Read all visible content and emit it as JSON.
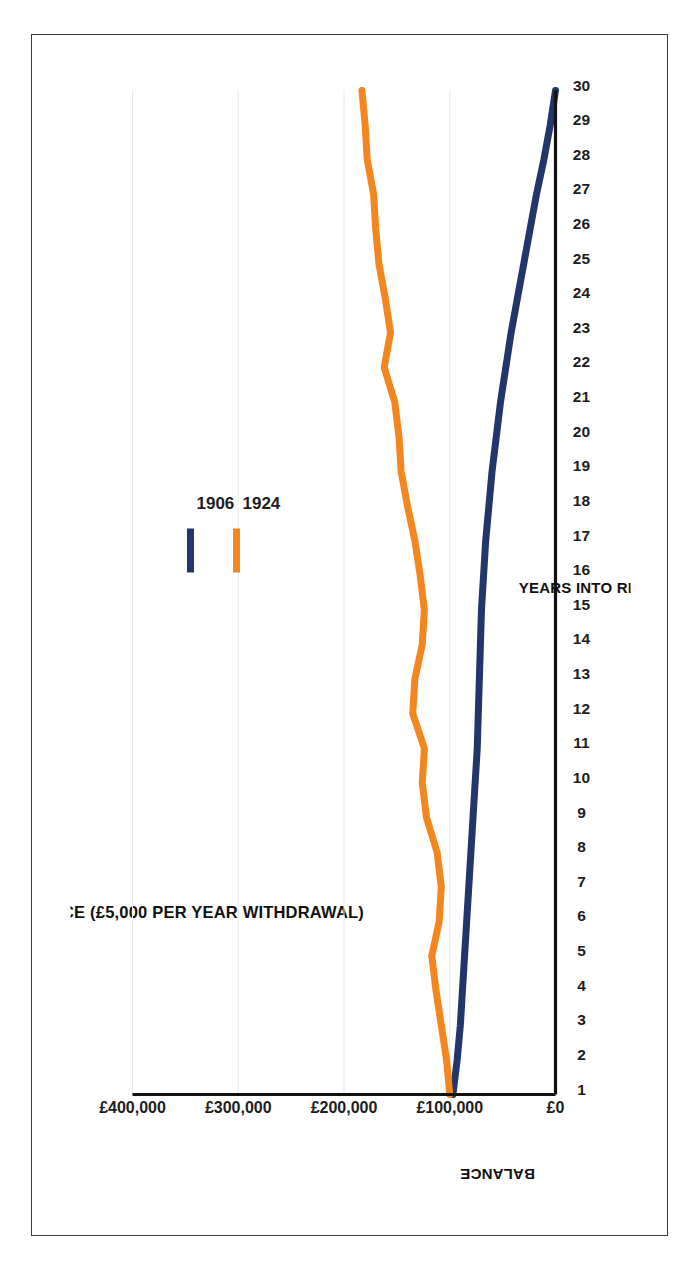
{
  "chart_data": {
    "type": "line",
    "title": "NOMINAL YEAR END BALANCE (£5,000 PER YEAR WITHDRAWAL)",
    "xlabel": "YEARS INTO RETIREMENT",
    "ylabel": "BALANCE",
    "xlim": [
      1,
      30
    ],
    "ylim": [
      0,
      400000
    ],
    "grid": true,
    "legend_position": "top-center",
    "orientation": "rotated-90-clockwise",
    "x": [
      1,
      2,
      3,
      4,
      5,
      6,
      7,
      8,
      9,
      10,
      11,
      12,
      13,
      14,
      15,
      16,
      17,
      18,
      19,
      20,
      21,
      22,
      23,
      24,
      25,
      26,
      27,
      28,
      29,
      30
    ],
    "xtick_labels": [
      "1",
      "2",
      "3",
      "4",
      "5",
      "6",
      "7",
      "8",
      "9",
      "10",
      "11",
      "12",
      "13",
      "14",
      "15",
      "16",
      "17",
      "18",
      "19",
      "20",
      "21",
      "22",
      "23",
      "24",
      "25",
      "26",
      "27",
      "28",
      "29",
      "30"
    ],
    "ytick_labels": [
      "£0",
      "£100,000",
      "£200,000",
      "£300,000",
      "£400,000"
    ],
    "ytick_values": [
      0,
      100000,
      200000,
      300000,
      400000
    ],
    "series": [
      {
        "name": "1906",
        "color": "#22366B",
        "values": [
          97000,
          93000,
          90000,
          88000,
          86000,
          84000,
          82000,
          80000,
          78000,
          76000,
          74000,
          73000,
          72000,
          71000,
          70000,
          68000,
          66000,
          63000,
          60000,
          56000,
          52000,
          47000,
          42000,
          36000,
          30000,
          24000,
          18000,
          11000,
          5000,
          0
        ]
      },
      {
        "name": "1924",
        "color": "#F4861F",
        "values": [
          100000,
          103000,
          108000,
          113000,
          117000,
          110000,
          108000,
          112000,
          122000,
          126000,
          124000,
          135000,
          133000,
          126000,
          124000,
          128000,
          133000,
          140000,
          146000,
          148000,
          152000,
          162000,
          156000,
          161000,
          167000,
          170000,
          172000,
          178000,
          180000,
          183000
        ]
      }
    ],
    "legend": [
      {
        "label": "1906",
        "color": "#22366B"
      },
      {
        "label": "1924",
        "color": "#F4861F"
      }
    ]
  },
  "colors": {
    "series_1906": "#22366B",
    "series_1924": "#F4861F",
    "axis": "#111111",
    "grid": "#e9e9e9",
    "page_border": "#3a3a3a",
    "background": "#ffffff"
  }
}
